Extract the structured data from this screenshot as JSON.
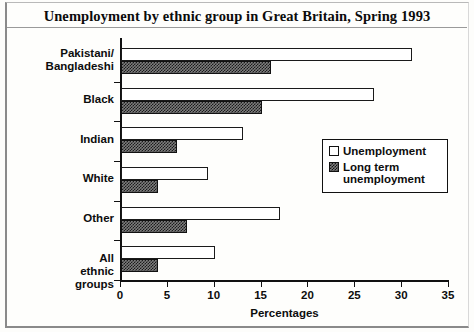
{
  "chart_data": {
    "type": "bar",
    "orientation": "horizontal",
    "title": "Unemployment by ethnic group in Great Britain, Spring 1993",
    "xlabel": "Percentages",
    "ylabel": "",
    "xlim": [
      0,
      35
    ],
    "xticks": [
      0,
      5,
      10,
      15,
      20,
      25,
      30,
      35
    ],
    "grid": false,
    "legend_position": "center-right",
    "categories": [
      "Pakistani/\nBangladeshi",
      "Black",
      "Indian",
      "White",
      "Other",
      "All ethnic groups"
    ],
    "series": [
      {
        "name": "Unemployment",
        "style": "open",
        "values": [
          31,
          27,
          13,
          9.3,
          17,
          10
        ]
      },
      {
        "name": "Long term\nunemployment",
        "style": "hatched",
        "values": [
          16,
          15,
          6,
          4,
          7,
          4
        ]
      }
    ]
  },
  "legend": {
    "items": [
      {
        "label": "Unemployment",
        "swatch": "open-square-icon"
      },
      {
        "label": "Long term\nunemployment",
        "swatch": "hatched-square-icon"
      }
    ]
  }
}
